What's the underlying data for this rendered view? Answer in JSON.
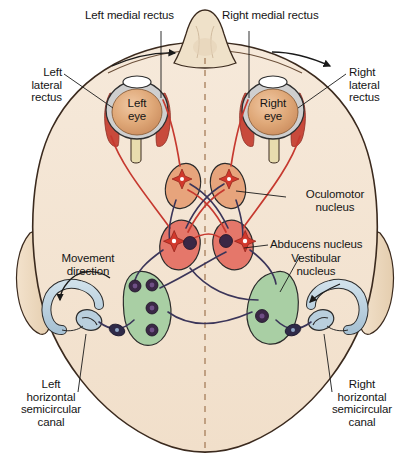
{
  "figure": {
    "view": "superior axial view of human head showing eyes, extraocular muscles, brainstem nuclei and horizontal semicircular canals"
  },
  "labels": {
    "left_medial_rectus": "Left medial rectus",
    "right_medial_rectus": "Right medial rectus",
    "left_lateral_rectus": "Left\nlateral\nrectus",
    "right_lateral_rectus": "Right\nlateral\nrectus",
    "left_eye": "Left\neye",
    "right_eye": "Right\neye",
    "oculomotor_nucleus": "Oculomotor\nnucleus",
    "abducens_nucleus": "Abducens nucleus",
    "vestibular_nucleus": "Vestibular\nnucleus",
    "movement_direction": "Movement\ndirection",
    "left_canal": "Left\nhorizontal\nsemicircular\ncanal",
    "right_canal": "Right\nhorizontal\nsemicircular\ncanal"
  },
  "colors": {
    "head_fill": "#f3e3d1",
    "head_outline": "#3b2a1e",
    "nose_fill": "#efe0c8",
    "ear_fill": "#efdcc2",
    "eye_iris": "#dfa878",
    "eye_sclera": "#cfcfcf",
    "eye_lens": "#ffffff",
    "muscle_red": "#c84a3c",
    "nerve_red": "#c6392f",
    "nerve_purple": "#3b3559",
    "oculomotor_fill": "#e7a47c",
    "abducens_fill": "#e5776a",
    "vestibular_fill": "#a9cfa4",
    "canal_fill": "#b9cfdd",
    "neuron_purple": "#3a2745",
    "neuron_star_red": "#d1382c",
    "midline_dash": "#b08a6a",
    "background": "#ffffff",
    "text": "#151515"
  },
  "structures": {
    "eyes": [
      "Left eye",
      "Right eye"
    ],
    "muscles": [
      "Left medial rectus",
      "Left lateral rectus",
      "Right medial rectus",
      "Right lateral rectus"
    ],
    "nuclei": [
      "Oculomotor nucleus (left)",
      "Oculomotor nucleus (right)",
      "Abducens nucleus (left)",
      "Abducens nucleus (right)",
      "Vestibular nucleus (left)",
      "Vestibular nucleus (right)"
    ],
    "canals": [
      "Left horizontal semicircular canal",
      "Right horizontal semicircular canal"
    ],
    "arrows": [
      "head rotation arrow left",
      "head rotation arrow right",
      "movement direction arrow",
      "vestibular nucleus pointer arrow"
    ]
  }
}
